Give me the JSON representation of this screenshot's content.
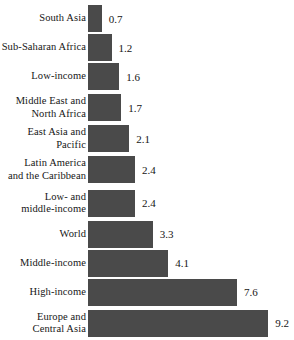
{
  "chart_data": {
    "type": "bar",
    "orientation": "horizontal",
    "title": "",
    "subtitle": "",
    "xlabel": "",
    "ylabel": "",
    "xlim": [
      0,
      9.2
    ],
    "grid": false,
    "legend": null,
    "bar_color": "#4a4a4a",
    "background_color": "#ffffff",
    "value_label_format": "one-decimal",
    "categories": [
      "South Asia",
      "Sub-Saharan Africa",
      "Low-income",
      "Middle East and\nNorth Africa",
      "East Asia and Pacific",
      "Latin America\nand the Caribbean",
      "Low- and\nmiddle-income",
      "World",
      "Middle-income",
      "High-income",
      "Europe and\nCentral Asia"
    ],
    "values": [
      0.7,
      1.2,
      1.6,
      1.7,
      2.1,
      2.4,
      2.4,
      3.3,
      4.1,
      7.6,
      9.2
    ],
    "value_labels": [
      "0.7",
      "1.2",
      "1.6",
      "1.7",
      "2.1",
      "2.4",
      "2.4",
      "3.3",
      "4.1",
      "7.6",
      "9.2"
    ]
  },
  "rows": [
    {
      "label": "South Asia",
      "value": 0.7,
      "value_label": "0.7",
      "lines": 1
    },
    {
      "label": "Sub-Saharan Africa",
      "value": 1.2,
      "value_label": "1.2",
      "lines": 1
    },
    {
      "label": "Low-income",
      "value": 1.6,
      "value_label": "1.6",
      "lines": 1
    },
    {
      "label": "Middle East and\nNorth Africa",
      "value": 1.7,
      "value_label": "1.7",
      "lines": 2
    },
    {
      "label": "East Asia and Pacific",
      "value": 2.1,
      "value_label": "2.1",
      "lines": 1
    },
    {
      "label": "Latin America\nand the Caribbean",
      "value": 2.4,
      "value_label": "2.4",
      "lines": 2
    },
    {
      "label": "Low- and\nmiddle-income",
      "value": 2.4,
      "value_label": "2.4",
      "lines": 2
    },
    {
      "label": "World",
      "value": 3.3,
      "value_label": "3.3",
      "lines": 1
    },
    {
      "label": "Middle-income",
      "value": 4.1,
      "value_label": "4.1",
      "lines": 1
    },
    {
      "label": "High-income",
      "value": 7.6,
      "value_label": "7.6",
      "lines": 1
    },
    {
      "label": "Europe and\nCentral Asia",
      "value": 9.2,
      "value_label": "9.2",
      "lines": 2
    }
  ],
  "scale": {
    "px_per_unit": 19.6,
    "bar_origin_x": 90,
    "bar_height_px": 27
  }
}
